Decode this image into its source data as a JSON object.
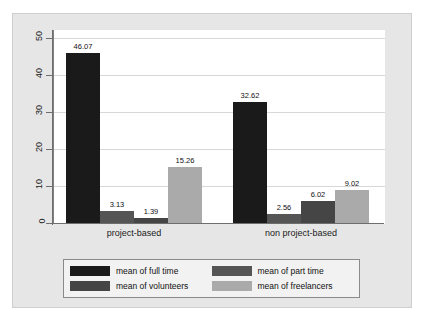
{
  "chart_data": {
    "type": "bar",
    "title": "",
    "subtitle": "",
    "xlabel": "",
    "ylabel": "",
    "categories": [
      "project-based",
      "non project-based"
    ],
    "series": [
      {
        "name": "mean of full time",
        "color": "#1a1a1a",
        "values": [
          46.07,
          32.62
        ],
        "labels": [
          "46.07",
          "32.62"
        ]
      },
      {
        "name": "mean of part time",
        "color": "#555555",
        "values": [
          3.13,
          2.56
        ],
        "labels": [
          "3.13",
          "2.56"
        ]
      },
      {
        "name": "mean of volunteers",
        "color": "#454545",
        "values": [
          1.39,
          6.02
        ],
        "labels": [
          "1.39",
          "6.02"
        ]
      },
      {
        "name": "mean of freelancers",
        "color": "#aaaaaa",
        "values": [
          15.26,
          9.02
        ],
        "labels": [
          "15.26",
          "9.02"
        ]
      }
    ],
    "ylim": [
      0,
      55
    ],
    "yticks": [
      "0",
      "10",
      "20",
      "30",
      "40",
      "50"
    ],
    "ytick_values": [
      0,
      10,
      20,
      30,
      40,
      50
    ],
    "grid": true,
    "grid_axis": "y",
    "legend_position": "bottom",
    "panel_background": "#e6e6e6",
    "plot_background": "#ffffff",
    "gridline_color": "#d8d8d8",
    "axis_color": "#6e6e6e"
  },
  "legend": {
    "entries": [
      {
        "label": "mean of full time"
      },
      {
        "label": "mean of part time"
      },
      {
        "label": "mean of volunteers"
      },
      {
        "label": "mean of freelancers"
      }
    ]
  },
  "axes": {
    "y": {
      "ticks": [
        "0",
        "10",
        "20",
        "30",
        "40",
        "50"
      ]
    },
    "x": {
      "ticks": [
        "project-based",
        "non project-based"
      ]
    }
  },
  "bars": [
    {
      "group": 0,
      "series": 0,
      "value": 46.07,
      "label": "46.07"
    },
    {
      "group": 0,
      "series": 1,
      "value": 3.13,
      "label": "3.13"
    },
    {
      "group": 0,
      "series": 2,
      "value": 1.39,
      "label": "1.39"
    },
    {
      "group": 0,
      "series": 3,
      "value": 15.26,
      "label": "15.26"
    },
    {
      "group": 1,
      "series": 0,
      "value": 32.62,
      "label": "32.62"
    },
    {
      "group": 1,
      "series": 1,
      "value": 2.56,
      "label": "2.56"
    },
    {
      "group": 1,
      "series": 2,
      "value": 6.02,
      "label": "6.02"
    },
    {
      "group": 1,
      "series": 3,
      "value": 9.02,
      "label": "9.02"
    }
  ]
}
